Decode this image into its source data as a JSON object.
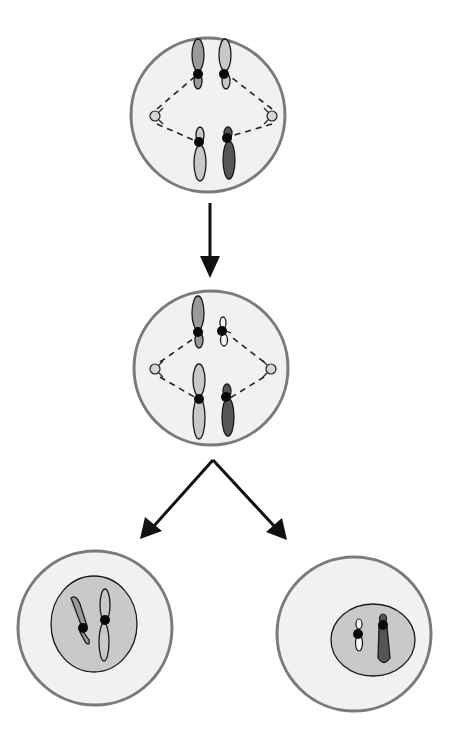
{
  "diagram": {
    "title": "",
    "type": "cell-division",
    "colors": {
      "background": "#ffffff",
      "cell_fill": "#f1f1f1",
      "cell_border": "#7a7a7a",
      "nucleus_fill": "#c9c9c9",
      "outline": "#1a1a1a",
      "centromere": "#0a0a0a",
      "chromatid_light": "#c8c8c8",
      "chromatid_mid": "#9a9a9a",
      "chromatid_dark": "#555555",
      "chromatid_white": "#f4f4f4",
      "centriole": "#d5d5d5",
      "arrow": "#111111"
    },
    "stages": [
      {
        "id": "parent-cell",
        "label": "",
        "chromosomes": 4,
        "spindle": true
      },
      {
        "id": "dividing-cell",
        "label": "",
        "chromosomes": 4,
        "spindle": true
      },
      {
        "id": "daughter-cell-left",
        "label": "",
        "chromosomes": 2,
        "nucleus": true
      },
      {
        "id": "daughter-cell-right",
        "label": "",
        "chromosomes": 2,
        "nucleus": true
      }
    ],
    "arrows": [
      {
        "from": "parent-cell",
        "to": "dividing-cell"
      },
      {
        "from": "dividing-cell",
        "to": "daughter-cell-left"
      },
      {
        "from": "dividing-cell",
        "to": "daughter-cell-right"
      }
    ]
  }
}
